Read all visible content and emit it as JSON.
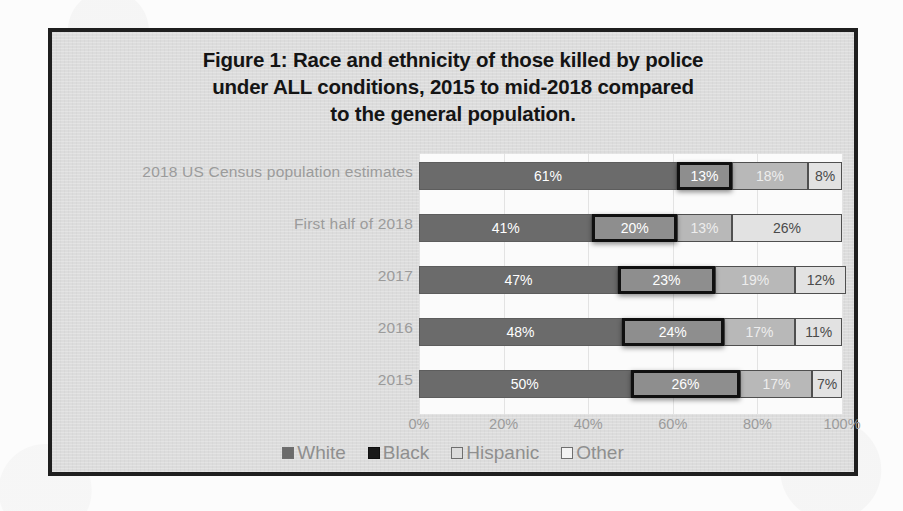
{
  "figure": {
    "title_lines": [
      "Figure 1: Race and ethnicity of those killed by police",
      "under ALL conditions, 2015 to mid-2018 compared",
      "to the general population."
    ]
  },
  "colors": {
    "white": "#6b6b6b",
    "black": "#8e8e8e",
    "black_outline": "#101010",
    "hispanic": "#b8b8b8",
    "other": "#e2e2e2",
    "panel": "#dcdcdc",
    "frame": "#1f1f1f",
    "label": "#9b9b9b"
  },
  "chart_data": {
    "type": "bar",
    "orientation": "horizontal",
    "stacked": true,
    "normalized": true,
    "title": "Figure 1: Race and ethnicity of those killed by police under ALL conditions, 2015 to mid-2018 compared to the general population.",
    "xlabel": "",
    "ylabel": "",
    "xlim": [
      0,
      100
    ],
    "xticks": [
      "0%",
      "20%",
      "40%",
      "60%",
      "80%",
      "100%"
    ],
    "xtick_values": [
      0,
      20,
      40,
      60,
      80,
      100
    ],
    "grid": true,
    "legend_position": "bottom",
    "legend": [
      "White",
      "Black",
      "Hispanic",
      "Other"
    ],
    "categories": [
      "2018 US Census population estimates",
      "First half of 2018",
      "2017",
      "2016",
      "2015"
    ],
    "series": [
      {
        "name": "White",
        "values": [
          61,
          41,
          47,
          48,
          50
        ],
        "labels": [
          "61%",
          "41%",
          "47%",
          "48%",
          "50%"
        ]
      },
      {
        "name": "Black",
        "values": [
          13,
          20,
          23,
          24,
          26
        ],
        "labels": [
          "13%",
          "20%",
          "23%",
          "24%",
          "26%"
        ],
        "emphasized": true
      },
      {
        "name": "Hispanic",
        "values": [
          18,
          13,
          19,
          17,
          17
        ],
        "labels": [
          "18%",
          "13%",
          "19%",
          "17%",
          "17%"
        ]
      },
      {
        "name": "Other",
        "values": [
          8,
          26,
          12,
          11,
          7
        ],
        "labels": [
          "8%",
          "26%",
          "12%",
          "11%",
          "7%"
        ]
      }
    ],
    "rows": [
      {
        "label": "2018 US Census population estimates",
        "segments": [
          {
            "series": "White",
            "value": 61,
            "label": "61%"
          },
          {
            "series": "Black",
            "value": 13,
            "label": "13%"
          },
          {
            "series": "Hispanic",
            "value": 18,
            "label": "18%"
          },
          {
            "series": "Other",
            "value": 8,
            "label": "8%"
          }
        ]
      },
      {
        "label": "First half of 2018",
        "segments": [
          {
            "series": "White",
            "value": 41,
            "label": "41%"
          },
          {
            "series": "Black",
            "value": 20,
            "label": "20%"
          },
          {
            "series": "Hispanic",
            "value": 13,
            "label": "13%"
          },
          {
            "series": "Other",
            "value": 26,
            "label": "26%"
          }
        ]
      },
      {
        "label": "2017",
        "segments": [
          {
            "series": "White",
            "value": 47,
            "label": "47%"
          },
          {
            "series": "Black",
            "value": 23,
            "label": "23%"
          },
          {
            "series": "Hispanic",
            "value": 19,
            "label": "19%"
          },
          {
            "series": "Other",
            "value": 12,
            "label": "12%"
          }
        ]
      },
      {
        "label": "2016",
        "segments": [
          {
            "series": "White",
            "value": 48,
            "label": "48%"
          },
          {
            "series": "Black",
            "value": 24,
            "label": "24%"
          },
          {
            "series": "Hispanic",
            "value": 17,
            "label": "17%"
          },
          {
            "series": "Other",
            "value": 11,
            "label": "11%"
          }
        ]
      },
      {
        "label": "2015",
        "segments": [
          {
            "series": "White",
            "value": 50,
            "label": "50%"
          },
          {
            "series": "Black",
            "value": 26,
            "label": "26%"
          },
          {
            "series": "Hispanic",
            "value": 17,
            "label": "17%"
          },
          {
            "series": "Other",
            "value": 7,
            "label": "7%"
          }
        ]
      }
    ]
  }
}
